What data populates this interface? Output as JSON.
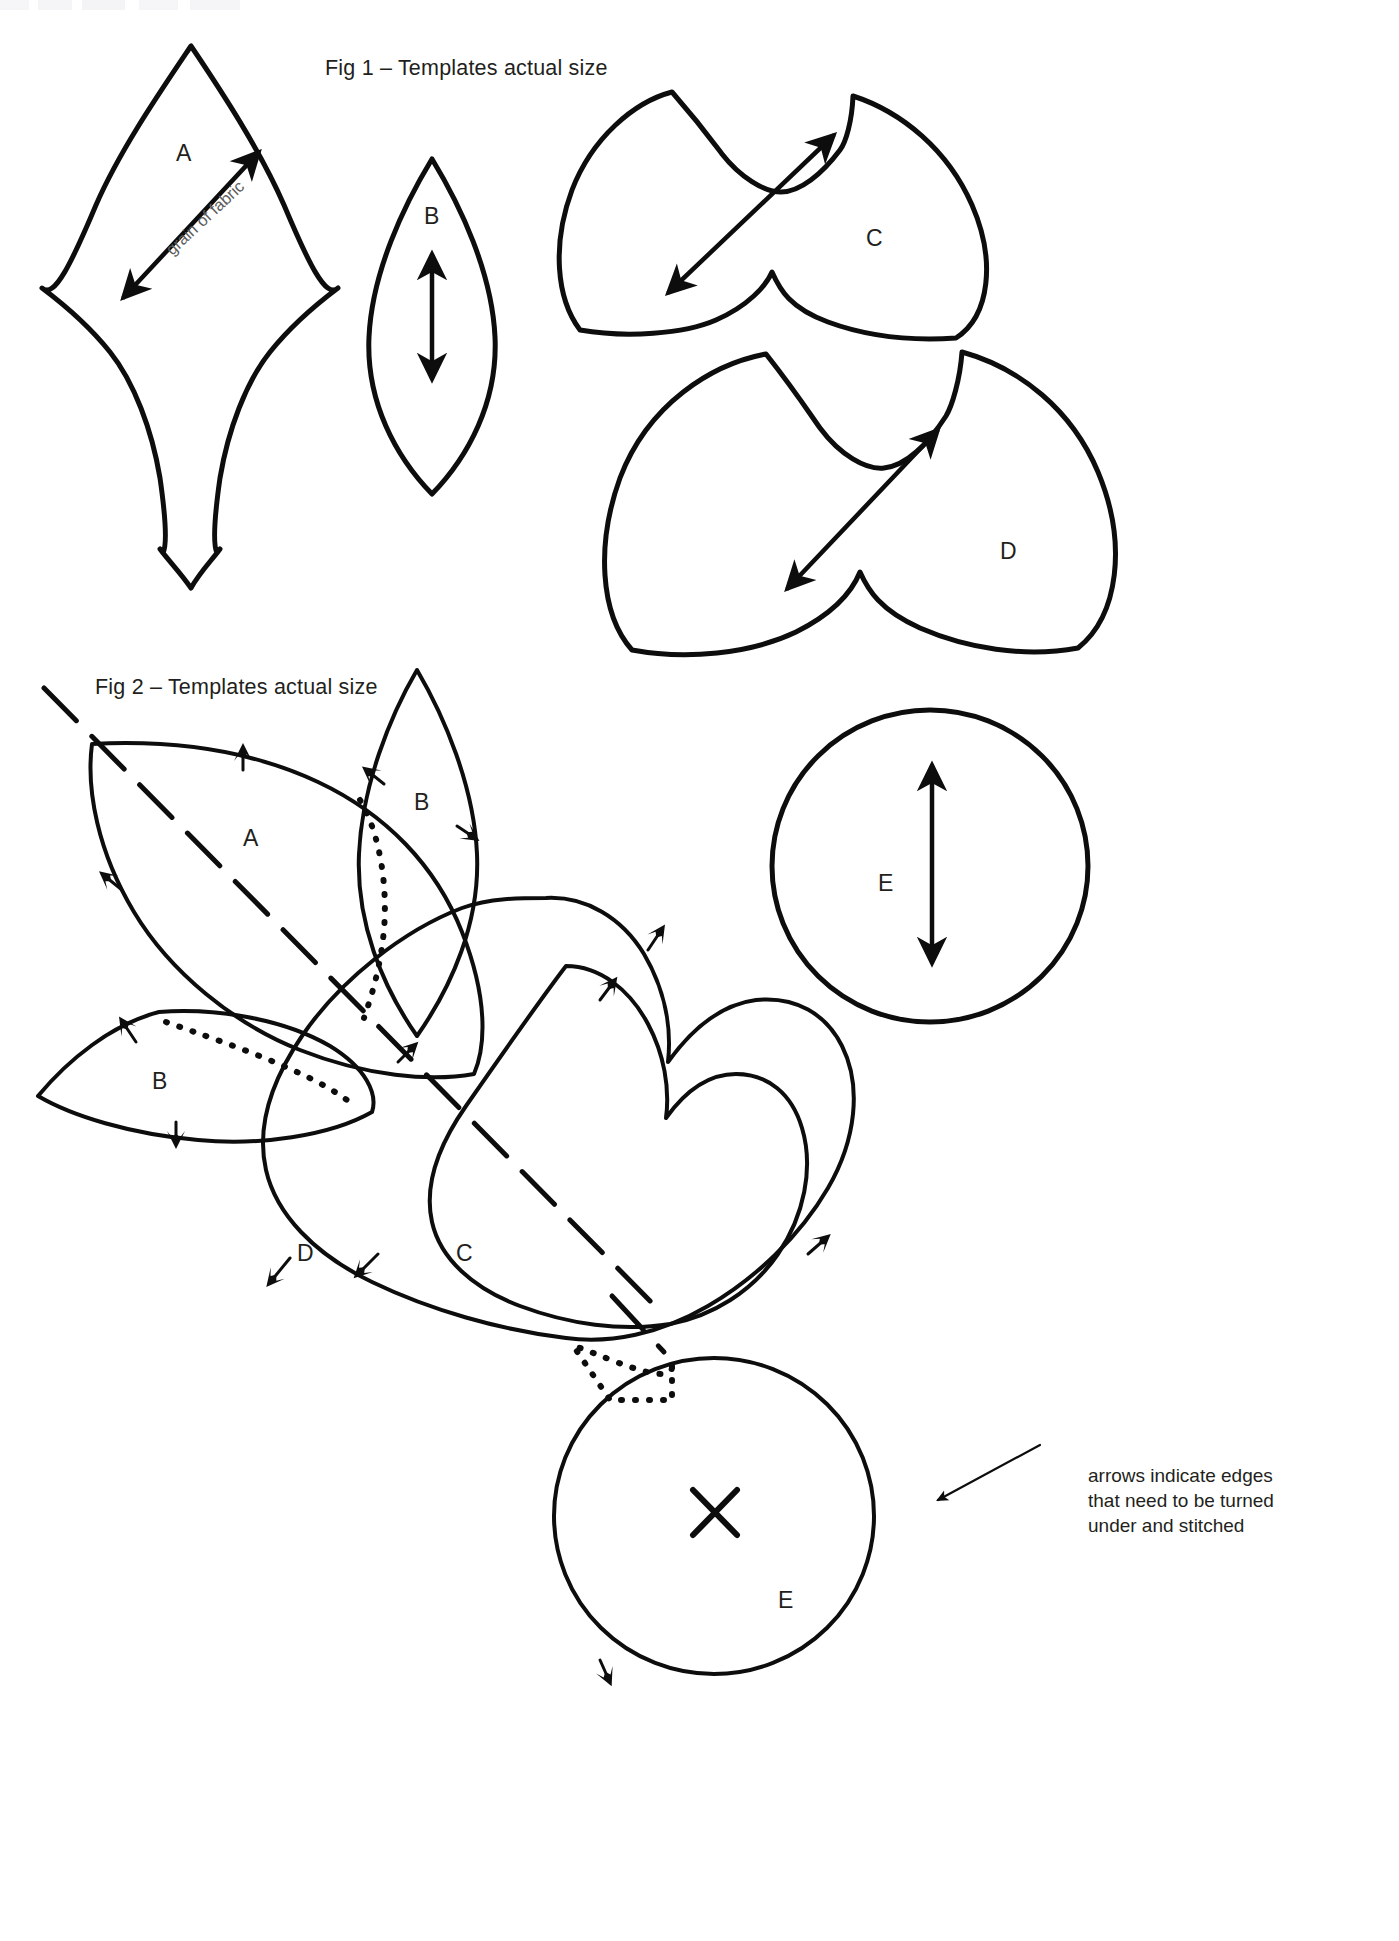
{
  "page": {
    "background": "#ffffff",
    "ink": "#0d0d0d",
    "muted_ink": "#5c5c5c",
    "width": 1399,
    "height": 1941
  },
  "fig1": {
    "title": "Fig 1 – Templates actual size",
    "grain_label": "grain of fabric",
    "pieces": [
      {
        "id": "A",
        "label": "A",
        "shape": "pointed-petal-with-tail",
        "grain_arrow": "double-headed-diagonal"
      },
      {
        "id": "B",
        "label": "B",
        "shape": "narrow-leaf",
        "grain_arrow": "double-headed-vertical"
      },
      {
        "id": "C",
        "label": "C",
        "shape": "heart-small",
        "grain_arrow": "double-headed-diagonal"
      },
      {
        "id": "D",
        "label": "D",
        "shape": "heart-large",
        "grain_arrow": "double-headed-diagonal"
      }
    ]
  },
  "fig2": {
    "title": "Fig 2 – Templates actual size",
    "annotation": [
      "arrows indicate edges",
      "that need to be turned",
      "under and stitched"
    ],
    "pieces": [
      {
        "id": "A",
        "label": "A",
        "shape": "large-leaf",
        "turn_arrows": 3
      },
      {
        "id": "B-upper",
        "label": "B",
        "shape": "narrow-leaf",
        "turn_arrows": 2
      },
      {
        "id": "B-left",
        "label": "B",
        "shape": "narrow-leaf",
        "turn_arrows": 2
      },
      {
        "id": "C",
        "label": "C",
        "shape": "heart",
        "turn_arrows": 2
      },
      {
        "id": "D",
        "label": "D",
        "shape": "heart-outer",
        "turn_arrows": 2
      },
      {
        "id": "E",
        "label": "E",
        "shape": "circle-with-cross",
        "turn_arrows": 2
      }
    ],
    "fold_line": "long-dashed-diagonal",
    "seam_line": "dotted-overlap"
  },
  "fig1_circle": {
    "label": "E",
    "shape": "circle",
    "grain_arrow": "double-headed-vertical"
  }
}
